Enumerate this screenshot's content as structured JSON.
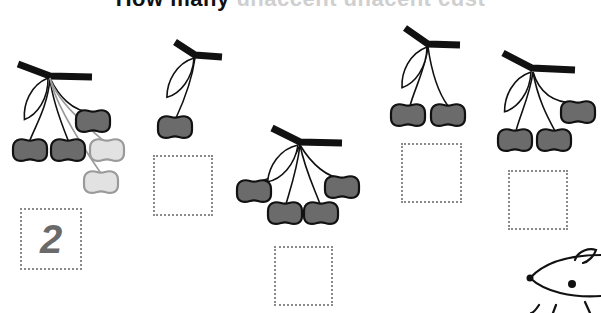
{
  "title": {
    "text_dark": "How many",
    "text_faded": "unaccent unacent cust",
    "note": "top of title cropped"
  },
  "colors": {
    "cherry_fill": "#6b6b6b",
    "cherry_outline": "#111111",
    "faded_fill": "#e2e2e2",
    "faded_outline": "#9a9a9a",
    "box_border": "#8a8a8a",
    "answer_text": "#6a6a6a"
  },
  "exercise": {
    "bunches": [
      {
        "id": 1,
        "dark_cherries": 4,
        "faded_cherries": 2,
        "answer": "2"
      },
      {
        "id": 2,
        "dark_cherries": 1,
        "answer": ""
      },
      {
        "id": 3,
        "dark_cherries": 4,
        "answer": ""
      },
      {
        "id": 4,
        "dark_cherries": 2,
        "answer": ""
      },
      {
        "id": 5,
        "dark_cherries": 3,
        "answer": ""
      }
    ]
  },
  "decoration": {
    "mascot": "mouse-illustration"
  }
}
